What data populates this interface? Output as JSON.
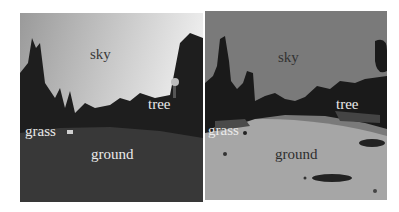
{
  "figure": {
    "left_panel": {
      "kind": "photograph",
      "description": "grayscale outdoor park scene",
      "labels": [
        "sky",
        "tree",
        "grass",
        "ground"
      ]
    },
    "right_panel": {
      "kind": "segmentation-map",
      "labels": [
        "sky",
        "tree",
        "grass",
        "ground"
      ]
    }
  },
  "colors": {
    "sky_photo": "#c8c8c8",
    "ground_photo": "#3a3a3a",
    "tree_photo": "#1e1e1e",
    "sky_seg": "#7a7a7a",
    "tree_seg": "#1a1a1a",
    "ground_seg": "#a6a6a6",
    "grass_seg": "#4a4a4a"
  }
}
